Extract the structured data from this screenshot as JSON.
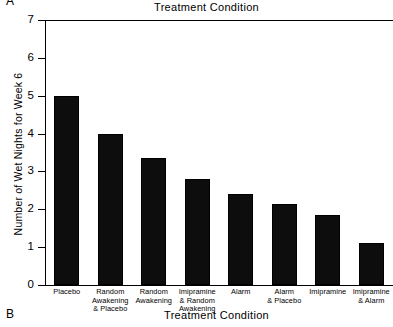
{
  "panels": {
    "top_letter": "A",
    "bottom_letter": "B"
  },
  "chart_data": {
    "type": "bar",
    "title": "Treatment Condition",
    "xlabel": "Treatment Condition",
    "ylabel": "Number of Wet Nights for Week 6",
    "categories": [
      "Placebo",
      "Random Awakening & Placebo",
      "Random Awakening",
      "Imipramine & Random Awakening",
      "Alarm",
      "Alarm & Placebo",
      "Imipramine",
      "Imipramine & Alarm"
    ],
    "category_lines": [
      [
        "Placebo"
      ],
      [
        "Random",
        "Awakening",
        "& Placebo"
      ],
      [
        "Random",
        "Awakening"
      ],
      [
        "Imipramine",
        "& Random",
        "Awakening"
      ],
      [
        "Alarm"
      ],
      [
        "Alarm",
        "& Placebo"
      ],
      [
        "Imipramine"
      ],
      [
        "Imipramine",
        "& Alarm"
      ]
    ],
    "values": [
      5.0,
      4.0,
      3.35,
      2.8,
      2.4,
      2.15,
      1.85,
      1.1
    ],
    "ylim": [
      0,
      7
    ],
    "yticks": [
      0,
      1,
      2,
      3,
      4,
      5,
      6,
      7
    ],
    "ytick_labels": [
      "0",
      "1",
      "2",
      "3",
      "4",
      "5",
      "6",
      "7"
    ],
    "grid": false,
    "legend": null,
    "bar_color": "#0d0d0d"
  }
}
